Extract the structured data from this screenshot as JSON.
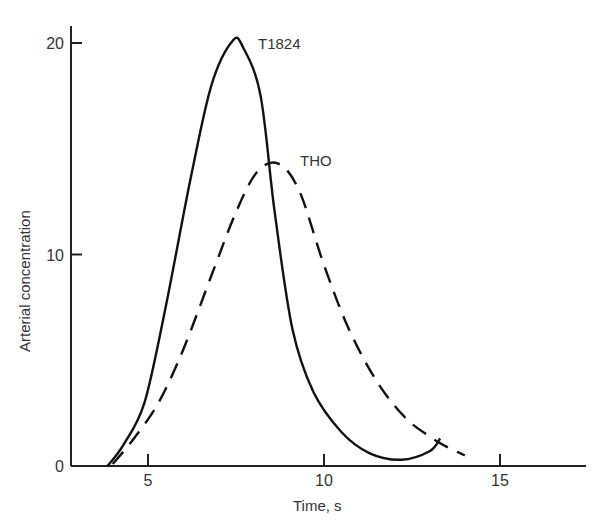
{
  "chart_data": {
    "type": "line",
    "title": "",
    "xlabel": "Time, s",
    "ylabel": "Arterial concentration",
    "xlim": [
      3,
      16.5
    ],
    "ylim": [
      0,
      21
    ],
    "x_ticks": [
      5,
      10,
      15
    ],
    "y_ticks": [
      0,
      10,
      20
    ],
    "x_tick_labels": [
      "5",
      "10",
      "15"
    ],
    "y_tick_labels": [
      "0",
      "10",
      "20"
    ],
    "grid": false,
    "legend": "inline labels",
    "series": [
      {
        "name": "T1824",
        "style": "solid",
        "x": [
          3.85,
          4.3,
          4.9,
          5.5,
          6.2,
          6.8,
          7.4,
          7.7,
          8.2,
          8.6,
          9.1,
          9.7,
          10.5,
          11.3,
          12.2,
          13.0,
          13.3
        ],
        "y": [
          0,
          1.0,
          3.0,
          7.5,
          13.5,
          18.0,
          20.1,
          19.8,
          17.5,
          12.0,
          6.5,
          3.5,
          1.6,
          0.6,
          0.3,
          0.7,
          1.3
        ]
      },
      {
        "name": "THO",
        "style": "dashed",
        "x": [
          4.0,
          4.6,
          5.3,
          6.0,
          6.8,
          7.5,
          8.1,
          8.7,
          9.3,
          10.0,
          10.7,
          11.5,
          12.3,
          13.0,
          13.5,
          14.0
        ],
        "y": [
          0.1,
          1.3,
          3.0,
          5.5,
          9.0,
          12.0,
          13.9,
          14.3,
          13.0,
          9.5,
          6.5,
          4.0,
          2.3,
          1.4,
          0.9,
          0.5
        ]
      }
    ],
    "annotations": [
      {
        "text": "T1824",
        "near": [
          7.9,
          20.2
        ]
      },
      {
        "text": "THO",
        "near": [
          9.3,
          14.3
        ]
      }
    ]
  },
  "labels": {
    "xlabel": "Time, s",
    "ylabel": "Arterial concentration",
    "series_a": "T1824",
    "series_b": "THO"
  }
}
